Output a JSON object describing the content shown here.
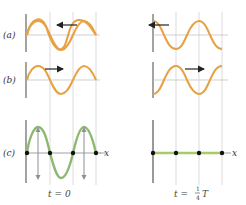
{
  "labels": {
    "a": "(a)",
    "b": "(b)",
    "c": "(c)",
    "x_axis": "x"
  },
  "captions": {
    "left": "t = 0",
    "right_prefix": "t = ",
    "right_num": "1",
    "right_den": "4",
    "right_suffix": "T"
  },
  "colors": {
    "wave_orange": "#e8a040",
    "wave_green": "#8db870",
    "flat_green": "#a6cc6a",
    "axis": "#666666",
    "grid": "#cccccc",
    "arrow": "#222222",
    "velocity_arrow": "#8a8f99",
    "dot": "#111111"
  },
  "panels": [
    {
      "id": "a-left",
      "direction": "left"
    },
    {
      "id": "b-left",
      "direction": "right"
    },
    {
      "id": "c-left",
      "description": "superposition at t=0, standing wave with velocity arrows"
    },
    {
      "id": "a-right",
      "direction": "left"
    },
    {
      "id": "b-right",
      "direction": "right"
    },
    {
      "id": "c-right",
      "description": "superposition at t=T/4, flat line"
    }
  ]
}
